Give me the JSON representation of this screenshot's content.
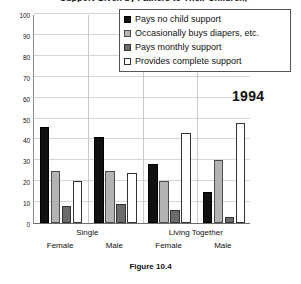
{
  "chart_data": {
    "type": "bar",
    "title": "Support Given by Fathers to Their Children, 1994",
    "subtitle": "",
    "xlabel": "",
    "ylabel": "",
    "ylim": [
      0,
      100
    ],
    "yticks": [
      0,
      10,
      20,
      30,
      40,
      50,
      60,
      70,
      80,
      90,
      100
    ],
    "ytick_labels": [
      "0",
      "10",
      "20",
      "30",
      "40",
      "50",
      "60",
      "70",
      "80",
      "90",
      "100"
    ],
    "grid": true,
    "legend_position": "top-right",
    "categories": [
      "Single Female",
      "Single Male",
      "Living Together Female",
      "Living Together Male"
    ],
    "group_headers": [
      "Single",
      "Living Together"
    ],
    "subcategories": [
      "Female",
      "Male",
      "Female",
      "Male"
    ],
    "series": [
      {
        "name": "Pays no child support",
        "color": "#111111",
        "values": [
          46,
          41,
          28,
          15
        ]
      },
      {
        "name": "Occasionally buys diapers, etc.",
        "color": "#b3b3b3",
        "values": [
          25,
          25,
          20,
          30
        ]
      },
      {
        "name": "Pays monthly support",
        "color": "#6b6b6b",
        "values": [
          8,
          9,
          6,
          3
        ]
      },
      {
        "name": "Provides complete support",
        "color": "#ffffff",
        "values": [
          20,
          24,
          43,
          48
        ]
      }
    ],
    "annotations": [
      {
        "text": "1994",
        "position": "plot-top-right"
      }
    ],
    "caption": "Figure 10.4"
  }
}
